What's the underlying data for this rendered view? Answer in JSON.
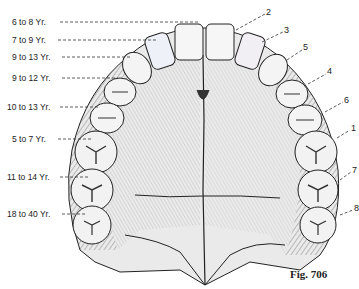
{
  "figure": {
    "caption": "Fig. 706"
  },
  "left_labels": [
    {
      "text": "6 to  8 Yr.",
      "x": 12,
      "y": 17,
      "line_to": [
        235,
        22
      ]
    },
    {
      "text": "7 to  9 Yr.",
      "x": 12,
      "y": 35,
      "line_to": [
        158,
        40
      ]
    },
    {
      "text": "9 to 13 Yr.",
      "x": 12,
      "y": 52,
      "line_to": [
        130,
        57
      ]
    },
    {
      "text": "9 to 12 Yr.",
      "x": 12,
      "y": 73,
      "line_to": [
        118,
        78
      ]
    },
    {
      "text": "10 to 13 Yr.",
      "x": 7,
      "y": 102,
      "line_to": [
        95,
        107
      ]
    },
    {
      "text": "5 to  7 Yr.",
      "x": 12,
      "y": 134,
      "line_to": [
        92,
        139
      ]
    },
    {
      "text": "11 to 14 Yr.",
      "x": 7,
      "y": 172,
      "line_to": [
        85,
        177
      ]
    },
    {
      "text": "18 to 40 Yr.",
      "x": 7,
      "y": 209,
      "line_to": [
        80,
        214
      ]
    }
  ],
  "right_labels": [
    {
      "text": "2",
      "x": 266,
      "y": 7,
      "line_from": [
        236,
        30
      ]
    },
    {
      "text": "3",
      "x": 284,
      "y": 25,
      "line_from": [
        262,
        42
      ]
    },
    {
      "text": "5",
      "x": 303,
      "y": 42,
      "line_from": [
        287,
        60
      ]
    },
    {
      "text": "4",
      "x": 327,
      "y": 66,
      "line_from": [
        308,
        84
      ]
    },
    {
      "text": "6",
      "x": 344,
      "y": 95,
      "line_from": [
        325,
        112
      ]
    },
    {
      "text": "1",
      "x": 351,
      "y": 123,
      "line_from": [
        337,
        138
      ]
    },
    {
      "text": "7",
      "x": 352,
      "y": 165,
      "line_from": [
        340,
        180
      ]
    },
    {
      "text": "8",
      "x": 354,
      "y": 203,
      "line_from": [
        340,
        215
      ]
    }
  ],
  "colors": {
    "ink": "#222222",
    "shade": "#888888",
    "tooth_fill": "#f4f4f4",
    "bone_fill": "#e6e6e6",
    "incisor_tint": "#c8d6e8"
  }
}
